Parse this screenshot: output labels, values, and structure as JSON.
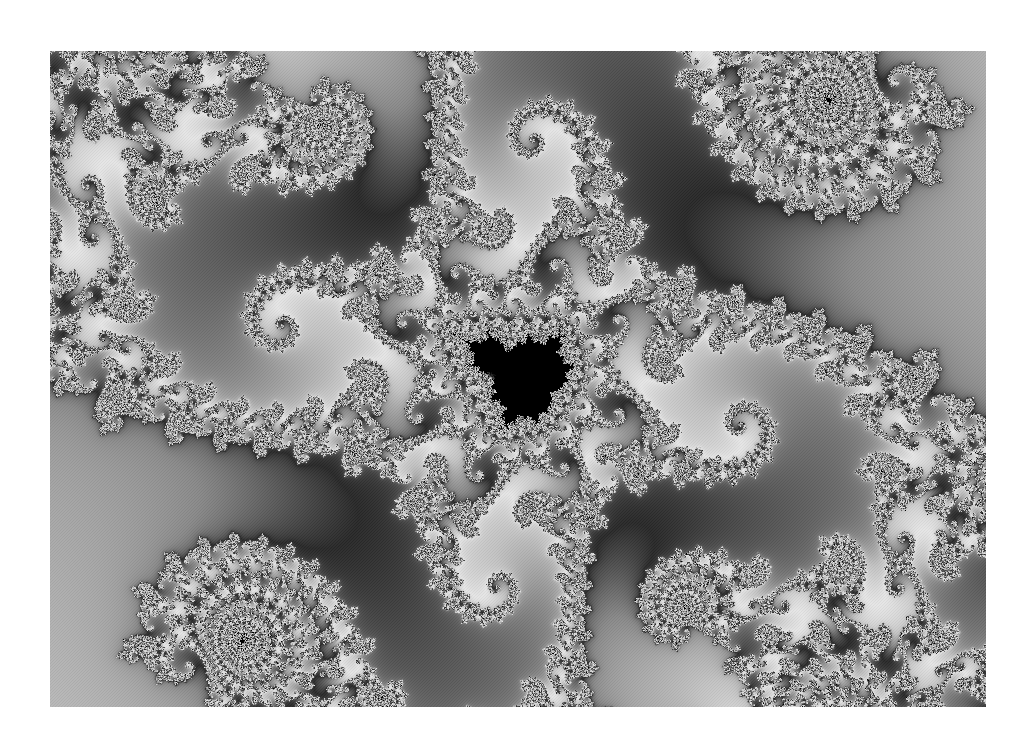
{
  "image": {
    "subject": "Mandelbrot set spiral (grayscale fractal print)",
    "bounds": {
      "left": 50,
      "top": 51,
      "width": 936,
      "height": 656
    },
    "spiral_center": {
      "x": 447,
      "y": 317
    },
    "palette": {
      "background": "#ffffff",
      "core": "#000000",
      "dark": "#2f2f2f",
      "mid_dark": "#5a5a5a",
      "mid": "#8c8c8c",
      "light": "#c4c4c4",
      "highlight": "#e6e6e6"
    },
    "spiral_arms": 60
  }
}
